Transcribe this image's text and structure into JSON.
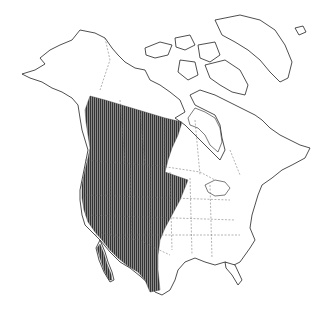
{
  "map": {
    "region": "North America",
    "type": "species range map",
    "range_fill": "vertical hatching",
    "colors": {
      "background": "#ffffff",
      "coastline": "#222222",
      "borders": "#666666",
      "range_hatch": "#3a3a3a"
    },
    "range_description": "Western North America from southern Alaska/Yukon coast south through western Canada and western United States into northern Mexico"
  }
}
